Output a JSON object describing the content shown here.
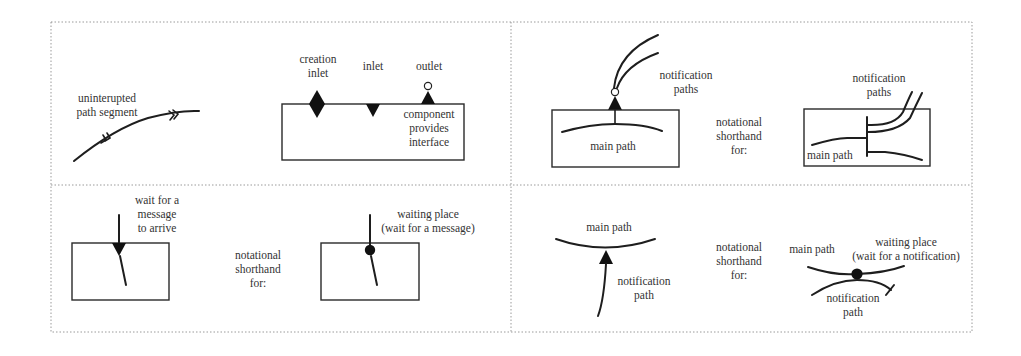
{
  "figure": {
    "panels": [
      {
        "id": "top-left",
        "parts": [
          {
            "id": "path-segment",
            "label_lines": [
              "uninterupted",
              "path segment"
            ]
          },
          {
            "id": "component",
            "labels": {
              "creation_inlet": [
                "creation",
                "inlet"
              ],
              "inlet": [
                "inlet"
              ],
              "outlet": [
                "outlet"
              ],
              "component_interface": [
                "component",
                "provides",
                "interface"
              ]
            }
          }
        ]
      },
      {
        "id": "top-right",
        "parts": [
          {
            "id": "notification-paths-expanded",
            "labels": {
              "notification_paths": [
                "notification",
                "paths"
              ],
              "main_path": "main path"
            }
          },
          {
            "id": "shorthand",
            "label_lines": [
              "notational",
              "shorthand",
              "for:"
            ]
          },
          {
            "id": "notification-paths-shorthand",
            "labels": {
              "notification_paths": [
                "notification",
                "paths"
              ],
              "main_path": "main path"
            }
          }
        ]
      },
      {
        "id": "bottom-left",
        "parts": [
          {
            "id": "wait-message",
            "label_lines": [
              "wait for a",
              "message",
              "to arrive"
            ]
          },
          {
            "id": "shorthand",
            "label_lines": [
              "notational",
              "shorthand",
              "for:"
            ]
          },
          {
            "id": "waiting-place-message",
            "label_lines": [
              "waiting place",
              "(wait for a message)"
            ]
          }
        ]
      },
      {
        "id": "bottom-right",
        "parts": [
          {
            "id": "notification-expanded",
            "labels": {
              "main_path": "main path",
              "notification_path": [
                "notification",
                "path"
              ]
            }
          },
          {
            "id": "shorthand",
            "label_lines": [
              "notational",
              "shorthand",
              "for:"
            ]
          },
          {
            "id": "waiting-place-notification",
            "labels": {
              "main_path": "main path",
              "waiting_place": [
                "waiting place",
                "(wait for a notification)"
              ],
              "notification_path": [
                "notification",
                "path"
              ]
            }
          }
        ]
      }
    ]
  }
}
